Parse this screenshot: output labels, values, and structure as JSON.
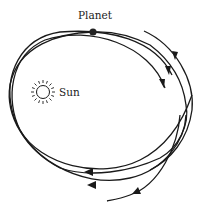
{
  "diagram": {
    "labels": {
      "planet": "Planet",
      "sun": "Sun"
    },
    "colors": {
      "line": "#1a1a1a",
      "background": "#ffffff"
    },
    "elements": {
      "orbits": 3,
      "direction": "clockwise",
      "arrowheads": 6
    }
  }
}
